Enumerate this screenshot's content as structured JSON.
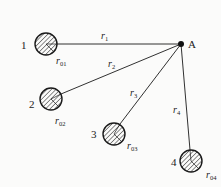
{
  "diagram": {
    "point": {
      "label": "A",
      "x": 181,
      "y": 44
    },
    "circles": [
      {
        "id": "1",
        "label": "1",
        "cx": 46,
        "cy": 44,
        "r": 11,
        "radius_label": "r",
        "radius_sub": "01",
        "lx": 23,
        "ly": 49,
        "rlx": 56,
        "rly": 64
      },
      {
        "id": "2",
        "label": "2",
        "cx": 51,
        "cy": 99,
        "r": 11,
        "radius_label": "r",
        "radius_sub": "02",
        "lx": 29,
        "ly": 108,
        "rlx": 55,
        "rly": 124
      },
      {
        "id": "3",
        "label": "3",
        "cx": 114,
        "cy": 134,
        "r": 11,
        "radius_label": "r",
        "radius_sub": "03",
        "lx": 91,
        "ly": 138,
        "rlx": 127,
        "rly": 149
      },
      {
        "id": "4",
        "label": "4",
        "cx": 191,
        "cy": 161,
        "r": 11,
        "radius_label": "r",
        "radius_sub": "04",
        "lx": 171,
        "ly": 166,
        "rlx": 206,
        "rly": 178
      }
    ],
    "distances": [
      {
        "label": "r",
        "sub": "1",
        "x": 101,
        "y": 39
      },
      {
        "label": "r",
        "sub": "2",
        "x": 108,
        "y": 67
      },
      {
        "label": "r",
        "sub": "3",
        "x": 130,
        "y": 96
      },
      {
        "label": "r",
        "sub": "4",
        "x": 173,
        "y": 113
      }
    ],
    "colors": {
      "stroke": "#1a1a1a",
      "hatch": "#333333",
      "background": "#fbfbfa"
    }
  }
}
